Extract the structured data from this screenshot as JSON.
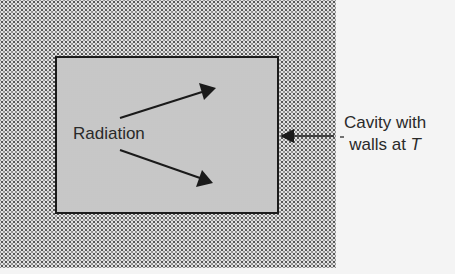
{
  "diagram": {
    "labels": {
      "radiation": "Radiation",
      "cavity_line1": "Cavity with",
      "cavity_line2_prefix": "walls at ",
      "cavity_line2_var": "T"
    },
    "elements": [
      {
        "type": "region",
        "name": "surrounding walls (stippled)"
      },
      {
        "type": "rectangle",
        "name": "cavity"
      },
      {
        "type": "arrow",
        "name": "radiation arrow up-right"
      },
      {
        "type": "arrow",
        "name": "radiation arrow down-right"
      },
      {
        "type": "arrow",
        "name": "pointer arrow to cavity wall"
      }
    ],
    "colors": {
      "line": "#1a1a1a",
      "stipple": "#555555",
      "background": "#f4f4f4"
    }
  }
}
